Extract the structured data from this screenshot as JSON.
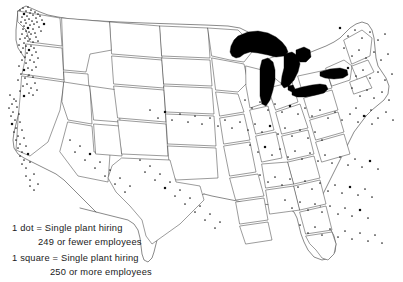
{
  "figure": {
    "type": "dot-density-map",
    "region": "United States (contiguous 48 states)",
    "background_color": "#ffffff",
    "outline_color": "#4a4a4a",
    "lake_fill_color": "#000000",
    "dot_color": "#222222"
  },
  "legend": {
    "line1": "1 dot = Single plant hiring",
    "line2": "249 or fewer employees",
    "line3": "1 square = Single plant hiring",
    "line4": "250 or more employees",
    "dot_symbol_label": "1 dot",
    "square_symbol_label": "1 square",
    "equals": "="
  },
  "chart_data": {
    "type": "scatter",
    "title": "",
    "xlabel": "",
    "ylabel": "",
    "projection": "conterminous United States outline",
    "marker_classes": [
      {
        "name": "dot",
        "meaning": "Single plant hiring 249 or fewer employees",
        "threshold_max": 249
      },
      {
        "name": "square",
        "meaning": "Single plant hiring 250 or more employees",
        "threshold_min": 250
      }
    ],
    "lakes_filled_black": [
      "Lake Superior",
      "Lake Michigan",
      "Lake Huron",
      "Lake Erie",
      "Lake Ontario"
    ],
    "density_notes": [
      {
        "region": "Puget Sound / Seattle, WA",
        "density": "very high"
      },
      {
        "region": "Portland, OR / Willamette Valley",
        "density": "high"
      },
      {
        "region": "San Francisco Bay Area, CA",
        "density": "moderate"
      },
      {
        "region": "Los Angeles / Southern California",
        "density": "moderate"
      },
      {
        "region": "Great Plains",
        "density": "very low"
      },
      {
        "region": "Midwest / Ohio Valley",
        "density": "moderate"
      },
      {
        "region": "Northeast / New England",
        "density": "moderate"
      },
      {
        "region": "Mid-Atlantic coast",
        "density": "moderate"
      },
      {
        "region": "Southeast / Carolinas / Georgia",
        "density": "moderate"
      },
      {
        "region": "Gulf Coast / Texas",
        "density": "low to moderate"
      },
      {
        "region": "Florida",
        "density": "low"
      }
    ],
    "points": [
      [
        20,
        10
      ],
      [
        23,
        8
      ],
      [
        26,
        11
      ],
      [
        28,
        7
      ],
      [
        30,
        13
      ],
      [
        24,
        14
      ],
      [
        27,
        16
      ],
      [
        31,
        10
      ],
      [
        33,
        15
      ],
      [
        29,
        19
      ],
      [
        25,
        20
      ],
      [
        35,
        12
      ],
      [
        22,
        17
      ],
      [
        32,
        21
      ],
      [
        36,
        18
      ],
      [
        38,
        14
      ],
      [
        26,
        23
      ],
      [
        30,
        25
      ],
      [
        34,
        24
      ],
      [
        28,
        28
      ],
      [
        24,
        26
      ],
      [
        21,
        22
      ],
      [
        37,
        22
      ],
      [
        40,
        16
      ],
      [
        42,
        20
      ],
      [
        33,
        29
      ],
      [
        29,
        32
      ],
      [
        26,
        31
      ],
      [
        23,
        29
      ],
      [
        31,
        34
      ],
      [
        27,
        36
      ],
      [
        35,
        33
      ],
      [
        39,
        27
      ],
      [
        44,
        24
      ],
      [
        25,
        38
      ],
      [
        30,
        39
      ],
      [
        22,
        34
      ],
      [
        36,
        37
      ],
      [
        41,
        31
      ],
      [
        28,
        41
      ],
      [
        24,
        43
      ],
      [
        33,
        42
      ],
      [
        20,
        39
      ],
      [
        26,
        46
      ],
      [
        31,
        46
      ],
      [
        38,
        41
      ],
      [
        23,
        48
      ],
      [
        29,
        50
      ],
      [
        34,
        48
      ],
      [
        19,
        45
      ],
      [
        27,
        53
      ],
      [
        32,
        55
      ],
      [
        25,
        57
      ],
      [
        36,
        52
      ],
      [
        21,
        52
      ],
      [
        30,
        60
      ],
      [
        26,
        63
      ],
      [
        34,
        62
      ],
      [
        22,
        60
      ],
      [
        38,
        58
      ],
      [
        28,
        68
      ],
      [
        24,
        70
      ],
      [
        32,
        70
      ],
      [
        19,
        66
      ],
      [
        36,
        67
      ],
      [
        29,
        75
      ],
      [
        25,
        78
      ],
      [
        33,
        77
      ],
      [
        21,
        74
      ],
      [
        27,
        84
      ],
      [
        31,
        88
      ],
      [
        23,
        86
      ],
      [
        35,
        83
      ],
      [
        18,
        80
      ],
      [
        29,
        93
      ],
      [
        24,
        96
      ],
      [
        33,
        95
      ],
      [
        20,
        91
      ],
      [
        37,
        90
      ],
      [
        10,
        95
      ],
      [
        14,
        99
      ],
      [
        12,
        104
      ],
      [
        16,
        101
      ],
      [
        9,
        108
      ],
      [
        13,
        112
      ],
      [
        17,
        107
      ],
      [
        11,
        116
      ],
      [
        15,
        120
      ],
      [
        19,
        114
      ],
      [
        12,
        124
      ],
      [
        16,
        128
      ],
      [
        20,
        122
      ],
      [
        14,
        132
      ],
      [
        18,
        136
      ],
      [
        22,
        130
      ],
      [
        16,
        140
      ],
      [
        20,
        144
      ],
      [
        24,
        138
      ],
      [
        18,
        148
      ],
      [
        22,
        152
      ],
      [
        26,
        146
      ],
      [
        20,
        156
      ],
      [
        24,
        160
      ],
      [
        28,
        154
      ],
      [
        22,
        164
      ],
      [
        26,
        168
      ],
      [
        30,
        162
      ],
      [
        26,
        176
      ],
      [
        30,
        180
      ],
      [
        34,
        174
      ],
      [
        30,
        186
      ],
      [
        34,
        190
      ],
      [
        38,
        184
      ],
      [
        70,
        140
      ],
      [
        75,
        152
      ],
      [
        80,
        146
      ],
      [
        85,
        160
      ],
      [
        90,
        154
      ],
      [
        95,
        168
      ],
      [
        100,
        162
      ],
      [
        105,
        176
      ],
      [
        110,
        170
      ],
      [
        115,
        184
      ],
      [
        120,
        178
      ],
      [
        125,
        192
      ],
      [
        130,
        186
      ],
      [
        140,
        160
      ],
      [
        145,
        172
      ],
      [
        150,
        166
      ],
      [
        155,
        180
      ],
      [
        160,
        174
      ],
      [
        165,
        188
      ],
      [
        170,
        182
      ],
      [
        175,
        196
      ],
      [
        180,
        190
      ],
      [
        185,
        204
      ],
      [
        190,
        198
      ],
      [
        195,
        212
      ],
      [
        200,
        206
      ],
      [
        205,
        220
      ],
      [
        210,
        214
      ],
      [
        215,
        228
      ],
      [
        220,
        222
      ],
      [
        150,
        110
      ],
      [
        158,
        118
      ],
      [
        165,
        112
      ],
      [
        172,
        120
      ],
      [
        180,
        114
      ],
      [
        188,
        122
      ],
      [
        195,
        116
      ],
      [
        202,
        124
      ],
      [
        210,
        118
      ],
      [
        218,
        126
      ],
      [
        225,
        120
      ],
      [
        232,
        128
      ],
      [
        240,
        122
      ],
      [
        248,
        130
      ],
      [
        255,
        124
      ],
      [
        262,
        132
      ],
      [
        270,
        126
      ],
      [
        278,
        134
      ],
      [
        285,
        128
      ],
      [
        292,
        136
      ],
      [
        300,
        130
      ],
      [
        308,
        138
      ],
      [
        315,
        132
      ],
      [
        322,
        140
      ],
      [
        245,
        100
      ],
      [
        252,
        108
      ],
      [
        260,
        102
      ],
      [
        268,
        110
      ],
      [
        275,
        104
      ],
      [
        282,
        112
      ],
      [
        290,
        106
      ],
      [
        298,
        114
      ],
      [
        305,
        108
      ],
      [
        312,
        116
      ],
      [
        320,
        110
      ],
      [
        328,
        118
      ],
      [
        335,
        112
      ],
      [
        342,
        120
      ],
      [
        350,
        114
      ],
      [
        358,
        122
      ],
      [
        365,
        116
      ],
      [
        372,
        124
      ],
      [
        250,
        145
      ],
      [
        258,
        152
      ],
      [
        265,
        147
      ],
      [
        272,
        155
      ],
      [
        280,
        149
      ],
      [
        288,
        157
      ],
      [
        295,
        151
      ],
      [
        302,
        159
      ],
      [
        310,
        153
      ],
      [
        318,
        161
      ],
      [
        325,
        155
      ],
      [
        332,
        163
      ],
      [
        340,
        157
      ],
      [
        348,
        165
      ],
      [
        355,
        159
      ],
      [
        362,
        167
      ],
      [
        370,
        161
      ],
      [
        378,
        169
      ],
      [
        260,
        175
      ],
      [
        268,
        182
      ],
      [
        275,
        177
      ],
      [
        282,
        185
      ],
      [
        290,
        179
      ],
      [
        298,
        187
      ],
      [
        305,
        181
      ],
      [
        312,
        189
      ],
      [
        320,
        183
      ],
      [
        328,
        191
      ],
      [
        335,
        185
      ],
      [
        342,
        193
      ],
      [
        350,
        187
      ],
      [
        358,
        195
      ],
      [
        365,
        189
      ],
      [
        372,
        197
      ],
      [
        285,
        200
      ],
      [
        292,
        208
      ],
      [
        300,
        202
      ],
      [
        308,
        210
      ],
      [
        315,
        204
      ],
      [
        322,
        212
      ],
      [
        330,
        206
      ],
      [
        338,
        214
      ],
      [
        345,
        208
      ],
      [
        352,
        216
      ],
      [
        360,
        210
      ],
      [
        368,
        218
      ],
      [
        300,
        225
      ],
      [
        308,
        233
      ],
      [
        315,
        227
      ],
      [
        322,
        235
      ],
      [
        330,
        229
      ],
      [
        338,
        237
      ],
      [
        345,
        231
      ],
      [
        352,
        239
      ],
      [
        360,
        233
      ],
      [
        368,
        241
      ],
      [
        375,
        235
      ],
      [
        382,
        243
      ],
      [
        340,
        28
      ],
      [
        348,
        36
      ],
      [
        355,
        30
      ],
      [
        362,
        38
      ],
      [
        370,
        32
      ],
      [
        378,
        40
      ],
      [
        385,
        34
      ],
      [
        344,
        48
      ],
      [
        352,
        56
      ],
      [
        359,
        50
      ],
      [
        366,
        58
      ],
      [
        374,
        52
      ],
      [
        381,
        60
      ],
      [
        388,
        54
      ],
      [
        348,
        68
      ],
      [
        356,
        76
      ],
      [
        363,
        70
      ],
      [
        370,
        78
      ],
      [
        378,
        72
      ],
      [
        385,
        80
      ],
      [
        392,
        74
      ],
      [
        352,
        88
      ],
      [
        360,
        96
      ],
      [
        367,
        90
      ],
      [
        374,
        98
      ],
      [
        382,
        92
      ],
      [
        389,
        100
      ],
      [
        356,
        108
      ],
      [
        364,
        116
      ],
      [
        371,
        110
      ],
      [
        378,
        118
      ],
      [
        386,
        112
      ],
      [
        393,
        120
      ]
    ]
  }
}
